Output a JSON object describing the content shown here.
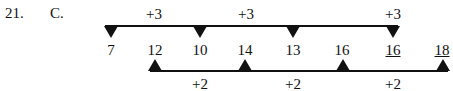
{
  "question": {
    "number": "21.",
    "answer": "C."
  },
  "sequence": [
    {
      "value": "7",
      "underlined": false
    },
    {
      "value": "12",
      "underlined": false
    },
    {
      "value": "10",
      "underlined": false
    },
    {
      "value": "14",
      "underlined": false
    },
    {
      "value": "13",
      "underlined": false
    },
    {
      "value": "16",
      "underlined": false
    },
    {
      "value": "16",
      "underlined": true
    },
    {
      "value": "18",
      "underlined": true
    }
  ],
  "top_series": {
    "step_labels": [
      "+3",
      "+3",
      "+3"
    ]
  },
  "bottom_series": {
    "step_labels": [
      "+2",
      "+2",
      "+2"
    ]
  }
}
